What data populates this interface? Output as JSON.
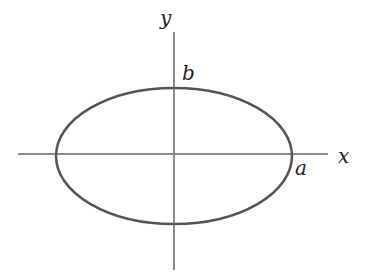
{
  "diagram": {
    "type": "ellipse-on-axes",
    "labels": {
      "x_axis": "x",
      "y_axis": "y",
      "semi_major": "a",
      "semi_minor": "b"
    },
    "colors": {
      "stroke": "#555555",
      "axis": "#666666",
      "text": "#222222"
    }
  }
}
